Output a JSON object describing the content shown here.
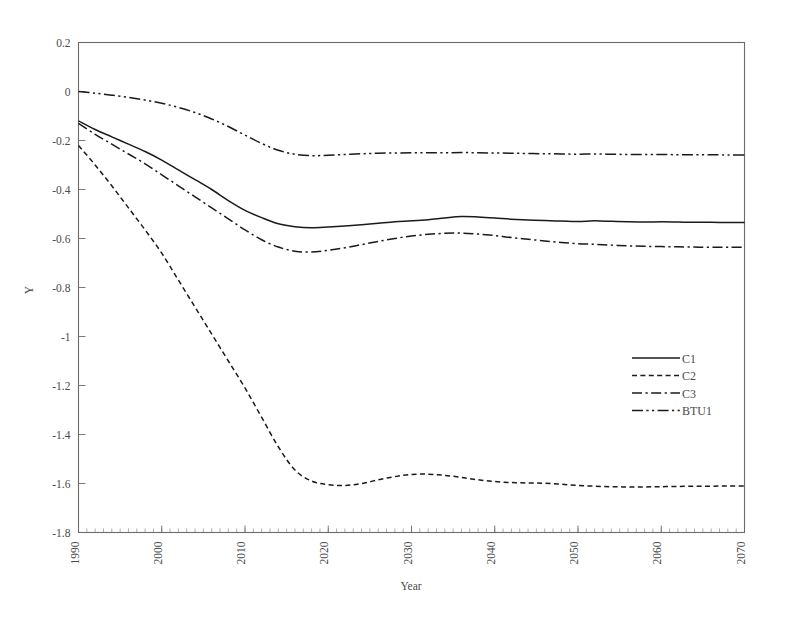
{
  "chart_data": {
    "type": "line",
    "title": "",
    "xlabel": "Year",
    "ylabel": "Y",
    "xlim": [
      1990,
      2070
    ],
    "ylim": [
      -1.8,
      0.2
    ],
    "grid": false,
    "legend_position": "center-right",
    "x_ticks": [
      1990,
      2000,
      2010,
      2020,
      2030,
      2040,
      2050,
      2060,
      2070
    ],
    "x_tick_labels": [
      "1990",
      "2000",
      "2010",
      "2020",
      "2030",
      "2040",
      "2050",
      "2060",
      "2070"
    ],
    "x_minor_tick_step": 1,
    "y_ticks": [
      0.2,
      0,
      -0.2,
      -0.4,
      -0.6,
      -0.8,
      -1,
      -1.2,
      -1.4,
      -1.6,
      -1.8
    ],
    "y_tick_labels": [
      "0.2",
      "0",
      "-0.2",
      "-0.4",
      "-0.6",
      "-0.8",
      "-1",
      "-1.2",
      "-1.4",
      "-1.6",
      "-1.8"
    ],
    "x": [
      1990,
      1992,
      1994,
      1996,
      1998,
      2000,
      2002,
      2004,
      2006,
      2008,
      2010,
      2012,
      2014,
      2016,
      2018,
      2020,
      2022,
      2024,
      2026,
      2028,
      2030,
      2032,
      2034,
      2036,
      2038,
      2040,
      2042,
      2044,
      2046,
      2048,
      2050,
      2052,
      2054,
      2056,
      2058,
      2060,
      2062,
      2064,
      2066,
      2068,
      2070
    ],
    "series": [
      {
        "name": "C1",
        "style": "solid",
        "values": [
          -0.12,
          -0.155,
          -0.185,
          -0.215,
          -0.245,
          -0.28,
          -0.32,
          -0.36,
          -0.4,
          -0.445,
          -0.485,
          -0.515,
          -0.54,
          -0.552,
          -0.556,
          -0.553,
          -0.549,
          -0.544,
          -0.538,
          -0.532,
          -0.528,
          -0.523,
          -0.516,
          -0.51,
          -0.512,
          -0.516,
          -0.521,
          -0.524,
          -0.527,
          -0.529,
          -0.531,
          -0.528,
          -0.53,
          -0.532,
          -0.533,
          -0.532,
          -0.533,
          -0.534,
          -0.534,
          -0.535,
          -0.535
        ]
      },
      {
        "name": "C2",
        "style": "dotted",
        "values": [
          -0.22,
          -0.3,
          -0.385,
          -0.475,
          -0.565,
          -0.66,
          -0.77,
          -0.88,
          -0.99,
          -1.1,
          -1.21,
          -1.33,
          -1.45,
          -1.545,
          -1.59,
          -1.605,
          -1.608,
          -1.6,
          -1.585,
          -1.572,
          -1.563,
          -1.562,
          -1.567,
          -1.575,
          -1.585,
          -1.592,
          -1.596,
          -1.598,
          -1.599,
          -1.603,
          -1.608,
          -1.611,
          -1.613,
          -1.614,
          -1.614,
          -1.613,
          -1.612,
          -1.611,
          -1.611,
          -1.61,
          -1.61
        ]
      },
      {
        "name": "C3",
        "style": "dashdot",
        "values": [
          -0.13,
          -0.175,
          -0.215,
          -0.255,
          -0.295,
          -0.34,
          -0.385,
          -0.43,
          -0.475,
          -0.52,
          -0.565,
          -0.605,
          -0.635,
          -0.652,
          -0.655,
          -0.648,
          -0.638,
          -0.625,
          -0.612,
          -0.6,
          -0.59,
          -0.583,
          -0.579,
          -0.578,
          -0.582,
          -0.588,
          -0.596,
          -0.603,
          -0.61,
          -0.616,
          -0.621,
          -0.624,
          -0.627,
          -0.63,
          -0.632,
          -0.633,
          -0.634,
          -0.635,
          -0.636,
          -0.636,
          -0.636
        ]
      },
      {
        "name": "BTU1",
        "style": "dashdotdot",
        "values": [
          0.0,
          -0.007,
          -0.015,
          -0.024,
          -0.035,
          -0.048,
          -0.065,
          -0.086,
          -0.112,
          -0.143,
          -0.178,
          -0.212,
          -0.24,
          -0.256,
          -0.262,
          -0.26,
          -0.257,
          -0.254,
          -0.252,
          -0.251,
          -0.25,
          -0.25,
          -0.25,
          -0.249,
          -0.25,
          -0.251,
          -0.252,
          -0.253,
          -0.254,
          -0.255,
          -0.256,
          -0.255,
          -0.256,
          -0.257,
          -0.257,
          -0.257,
          -0.258,
          -0.258,
          -0.258,
          -0.259,
          -0.259
        ]
      }
    ]
  },
  "legend": {
    "entries": [
      {
        "label": "C1",
        "style": "solid"
      },
      {
        "label": "C2",
        "style": "dotted"
      },
      {
        "label": "C3",
        "style": "dashdot"
      },
      {
        "label": "BTU1",
        "style": "dashdotdot"
      }
    ]
  },
  "colors": {
    "line": "#1a1a1a",
    "axis": "#6b6b6b",
    "text": "#4a4a4a",
    "background": "#ffffff"
  }
}
